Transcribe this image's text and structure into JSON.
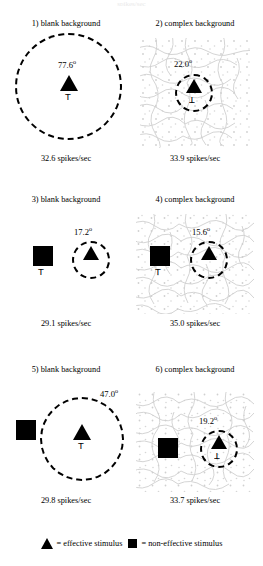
{
  "figure": {
    "cropped_header": "spikes/sec",
    "panels": [
      {
        "id": "panel-1",
        "title": "1) blank background",
        "background": "blank",
        "angle": "77.6",
        "degree_symbol": "o",
        "rate": "32.6 spikes/sec",
        "t_marker": "T",
        "has_square": false,
        "has_triangle": true
      },
      {
        "id": "panel-2",
        "title": "2) complex background",
        "background": "complex",
        "angle": "22.0",
        "degree_symbol": "o",
        "rate": "33.9 spikes/sec",
        "t_marker": "T",
        "has_square": false,
        "has_triangle": true
      },
      {
        "id": "panel-3",
        "title": "3) blank background",
        "background": "blank",
        "angle": "17.2",
        "degree_symbol": "o",
        "rate": "29.1 spikes/sec",
        "t_marker": "T",
        "has_square": true,
        "has_triangle": true
      },
      {
        "id": "panel-4",
        "title": "4) complex background",
        "background": "complex",
        "angle": "15.6",
        "degree_symbol": "o",
        "rate": "35.0 spikes/sec",
        "t_marker": "T",
        "has_square": true,
        "has_triangle": true
      },
      {
        "id": "panel-5",
        "title": "5) blank background",
        "background": "blank",
        "angle": "47.0",
        "degree_symbol": "o",
        "rate": "29.8 spikes/sec",
        "t_marker": "T",
        "has_square": true,
        "has_triangle": true
      },
      {
        "id": "panel-6",
        "title": "6) complex background",
        "background": "complex",
        "angle": "19.2",
        "degree_symbol": "o",
        "rate": "33.7 spikes/sec",
        "t_marker": "T",
        "has_square": true,
        "has_triangle": true
      }
    ],
    "legend": {
      "effective": "= effective stimulus",
      "non_effective": "= non-effective stimulus",
      "effective_icon": "triangle-icon",
      "non_effective_icon": "square-icon"
    },
    "colors": {
      "ink": "#000000",
      "paper": "#ffffff",
      "texture": "#d6d6d6"
    }
  }
}
